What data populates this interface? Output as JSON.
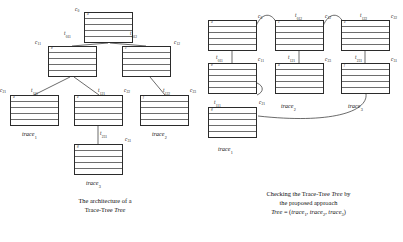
{
  "figure": {
    "left_panel": {
      "caption_line1": "The architecture of a",
      "caption_line2_prefix": "Trace-Tree",
      "caption_line2_italic": "Tree",
      "nodes": [
        {
          "id": "root",
          "label": "c",
          "sub": "0",
          "head": "a",
          "rows": 5,
          "x": 84,
          "y": 12,
          "w": 49,
          "h": 31
        },
        {
          "id": "n11",
          "label": "c",
          "sub": "11",
          "head": "b",
          "rows": 5,
          "x": 48,
          "y": 46,
          "w": 49,
          "h": 31
        },
        {
          "id": "n12",
          "label": "c",
          "sub": "12",
          "head": "c",
          "rows": 5,
          "x": 122,
          "y": 46,
          "w": 49,
          "h": 31
        },
        {
          "id": "n21",
          "label": "c",
          "sub": "21",
          "head": "d",
          "rows": 5,
          "x": 10,
          "y": 95,
          "w": 49,
          "h": 31
        },
        {
          "id": "n22",
          "label": "c",
          "sub": "22",
          "head": "e",
          "rows": 5,
          "x": 74,
          "y": 95,
          "w": 49,
          "h": 31
        },
        {
          "id": "n23",
          "label": "c",
          "sub": "23",
          "head": "f",
          "rows": 5,
          "x": 140,
          "y": 95,
          "w": 49,
          "h": 31
        },
        {
          "id": "n31",
          "label": "c",
          "sub": "31",
          "head": "g",
          "rows": 5,
          "x": 74,
          "y": 144,
          "w": 49,
          "h": 31
        }
      ],
      "edges": [
        {
          "label": "t",
          "sub": "011"
        },
        {
          "label": "t",
          "sub": "012"
        },
        {
          "label": "t",
          "sub": "111"
        },
        {
          "label": "t",
          "sub": "121"
        },
        {
          "label": "t",
          "sub": "122"
        },
        {
          "label": "t",
          "sub": "231"
        }
      ],
      "trace_labels": [
        {
          "label": "trace",
          "sub": "1"
        },
        {
          "label": "trace",
          "sub": "2"
        },
        {
          "label": "trace",
          "sub": "3"
        }
      ]
    },
    "right_panel": {
      "caption_line1_prefix": "Checking the Trace-Tree",
      "caption_line1_italic": "Tree",
      "caption_line1_suffix": "by",
      "caption_line2": "the proposed approach",
      "caption_line3_parts": {
        "tree": "Tree",
        "equals": "= (",
        "t1": "trace",
        "t1sub": "1",
        "t2": "trace",
        "t2sub": "2",
        "t3": "trace",
        "t3sub": "3",
        "close": ")"
      },
      "nodes": [
        {
          "id": "r_c0",
          "label": "c",
          "sub": "0",
          "head": "a",
          "rows": 5,
          "x": 208,
          "y": 20,
          "w": 49,
          "h": 31
        },
        {
          "id": "r_c11",
          "label": "c",
          "sub": "11",
          "head": "b",
          "rows": 5,
          "x": 208,
          "y": 63,
          "w": 49,
          "h": 31
        },
        {
          "id": "r_c12",
          "label": "c",
          "sub": "12",
          "head": "c",
          "rows": 5,
          "x": 275,
          "y": 20,
          "w": 49,
          "h": 31
        },
        {
          "id": "r_c21",
          "label": "c",
          "sub": "21",
          "head": "d",
          "rows": 5,
          "x": 275,
          "y": 63,
          "w": 49,
          "h": 31
        },
        {
          "id": "r_c22",
          "label": "c",
          "sub": "22",
          "head": "e",
          "rows": 5,
          "x": 341,
          "y": 20,
          "w": 49,
          "h": 31
        },
        {
          "id": "r_c31",
          "label": "c",
          "sub": "31",
          "head": "f",
          "rows": 5,
          "x": 341,
          "y": 63,
          "w": 49,
          "h": 31
        },
        {
          "id": "r_t1",
          "label": "c",
          "sub": "",
          "head": "g",
          "rows": 5,
          "x": 208,
          "y": 107,
          "w": 49,
          "h": 31
        }
      ],
      "edges": [
        {
          "label": "t",
          "sub": "011"
        },
        {
          "label": "t",
          "sub": "012"
        },
        {
          "label": "t",
          "sub": "111"
        },
        {
          "label": "t",
          "sub": "121"
        },
        {
          "label": "t",
          "sub": "122"
        },
        {
          "label": "t",
          "sub": "231"
        }
      ],
      "trace_labels": [
        {
          "label": "trace",
          "sub": "1"
        },
        {
          "label": "trace",
          "sub": "2"
        },
        {
          "label": "trace",
          "sub": "3"
        }
      ]
    }
  },
  "labels": {
    "L_c0": "c",
    "L_c0_s": "0",
    "L_c11": "c",
    "L_c11_s": "11",
    "L_c12": "c",
    "L_c12_s": "12",
    "L_c21": "c",
    "L_c21_s": "21",
    "L_c22": "c",
    "L_c22_s": "22",
    "L_c23": "c",
    "L_c23_s": "23",
    "L_c31": "c",
    "L_c31_s": "31",
    "L_t011": "t",
    "L_t011_s": "011",
    "L_t012": "t",
    "L_t012_s": "012",
    "L_t111": "t",
    "L_t111_s": "111",
    "L_t121": "t",
    "L_t121_s": "121",
    "L_t122": "t",
    "L_t122_s": "122",
    "L_t231": "t",
    "L_t231_s": "231",
    "L_trace": "trace",
    "s1": "1",
    "s2": "2",
    "s3": "3",
    "head_a": "a",
    "head_b": "b",
    "head_c": "c",
    "head_d": "d",
    "head_e": "e",
    "head_f": "f",
    "head_g": "g",
    "head_h": "h",
    "head_i": "i",
    "head_j": "j",
    "head_k": "k",
    "head_l": "l",
    "head_m": "m",
    "head_n": "n"
  },
  "captions": {
    "left_l1": "The architecture of a",
    "left_l2a": "Trace-Tree",
    "left_l2b": "Tree",
    "right_l1a": "Checking the Trace-Tree",
    "right_l1b": "Tree",
    "right_l1c": "by",
    "right_l2": "the proposed approach",
    "right_l3_tree": "Tree",
    "right_l3_eq": "= (",
    "right_l3_trace": "trace",
    "right_l3_comma": ",",
    "right_l3_close": ")"
  },
  "colors": {
    "stroke": "#2b2b2b",
    "rule": "#6d6d6d",
    "text": "#111111",
    "background": "#ffffff"
  }
}
